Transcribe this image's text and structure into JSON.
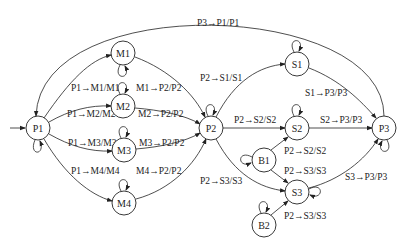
{
  "diagram": {
    "type": "state-transition-diagram",
    "nodes": [
      {
        "id": "P1",
        "label": "P1",
        "x": 38,
        "y": 128
      },
      {
        "id": "M1",
        "label": "M1",
        "x": 123,
        "y": 53
      },
      {
        "id": "M2",
        "label": "M2",
        "x": 123,
        "y": 106
      },
      {
        "id": "M3",
        "label": "M3",
        "x": 124,
        "y": 150
      },
      {
        "id": "M4",
        "label": "M4",
        "x": 124,
        "y": 203
      },
      {
        "id": "P2",
        "label": "P2",
        "x": 211,
        "y": 128
      },
      {
        "id": "S1",
        "label": "S1",
        "x": 297,
        "y": 64
      },
      {
        "id": "S2",
        "label": "S2",
        "x": 297,
        "y": 128
      },
      {
        "id": "S3",
        "label": "S3",
        "x": 297,
        "y": 192
      },
      {
        "id": "B1",
        "label": "B1",
        "x": 264,
        "y": 160
      },
      {
        "id": "B2",
        "label": "B2",
        "x": 264,
        "y": 225
      },
      {
        "id": "P3",
        "label": "P3",
        "x": 384,
        "y": 128
      }
    ],
    "edge_labels": {
      "p3_p1": "P3→P1/P1",
      "p1_m1": "P1→M1/M1",
      "p1_m2": "P1→M2/M2",
      "p1_m3": "P1→M3/M3",
      "p1_m4": "P1→M4/M4",
      "m1_p2": "M1→P2/P2",
      "m2_p2": "M2→P2/P2",
      "m3_p2": "M3→P2/P2",
      "m4_p2": "M4→P2/P2",
      "p2_s1": "P2→S1/S1",
      "p2_s2": "P2→S2/S2",
      "p2_s3": "P2→S3/S3",
      "b1_s2": "P2→S2/S2",
      "b1_s3": "P2→S3/S3",
      "b2_s3": "P2→S3/S3",
      "s1_p3": "S1→P3/P3",
      "s2_p3": "S2→P3/P3",
      "s3_p3": "S3→P3/P3"
    },
    "self_loops": [
      "P1",
      "M1",
      "M2",
      "M3",
      "M4",
      "P2",
      "S1",
      "S2",
      "S3",
      "B1",
      "B2",
      "P3"
    ],
    "initial_state": "P1"
  }
}
